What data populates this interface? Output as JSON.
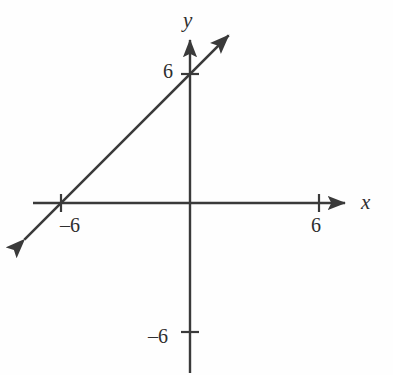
{
  "figure": {
    "kind": "coordinate-plane-line-graph",
    "width": 393,
    "height": 375,
    "background_color": "#fefefe",
    "ink_color": "#3a3a3a"
  },
  "axes": {
    "x_axis_label": "x",
    "y_axis_label": "y",
    "origin_px": {
      "x": 190,
      "y": 203
    },
    "unit_px": 21.5
  },
  "tick_labels": {
    "y_positive": "6",
    "y_negative": "–6",
    "x_positive": "6",
    "x_negative": "–6"
  },
  "chart_data": {
    "type": "line",
    "title": "",
    "xlabel": "x",
    "ylabel": "y",
    "grid": false,
    "legend": "none",
    "xlim": [
      -8,
      8
    ],
    "ylim": [
      -8,
      8
    ],
    "xticks": [
      -6,
      6
    ],
    "yticks": [
      -6,
      6
    ],
    "xtick_labels": [
      "–6",
      "6"
    ],
    "ytick_labels": [
      "–6",
      "6"
    ],
    "series": [
      {
        "name": "line",
        "equation": "y = x + 6",
        "slope": 1,
        "y_intercept": 6,
        "x_intercept": -6,
        "arrow_start": true,
        "arrow_end": true,
        "x": [
          -7.7,
          1.8
        ],
        "y": [
          -1.7,
          7.8
        ],
        "points_labeled": [
          {
            "x": -6,
            "y": 0
          },
          {
            "x": 0,
            "y": 6
          }
        ]
      }
    ]
  }
}
